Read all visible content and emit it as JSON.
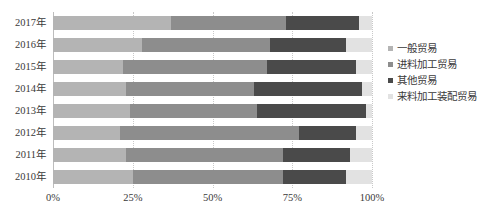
{
  "chart_data": {
    "type": "bar",
    "subtype": "stacked-bar-100-horizontal",
    "title": "",
    "xlabel": "",
    "ylabel": "",
    "orientation": "horizontal",
    "stacked": true,
    "normalized_percent": true,
    "grid": true,
    "legend_position": "right",
    "xlim": [
      0,
      100
    ],
    "xticks": [
      0,
      25,
      50,
      75,
      100
    ],
    "xticklabels": [
      "0%",
      "25%",
      "50%",
      "75%",
      "100%"
    ],
    "categories": [
      "2017年",
      "2016年",
      "2015年",
      "2014年",
      "2013年",
      "2012年",
      "2011年",
      "2010年"
    ],
    "series": [
      {
        "name": "一般贸易",
        "color": "#b4b4b4",
        "values": [
          37,
          28,
          22,
          23,
          24,
          21,
          23,
          25
        ]
      },
      {
        "name": "进料加工贸易",
        "color": "#8d8d8d",
        "values": [
          36,
          40,
          45,
          40,
          40,
          56,
          49,
          47
        ]
      },
      {
        "name": "其他贸易",
        "color": "#4a4a4a",
        "values": [
          23,
          24,
          28,
          34,
          34,
          18,
          21,
          20
        ]
      },
      {
        "name": "来料加工装配贸易",
        "color": "#e2e2e2",
        "values": [
          4,
          8,
          5,
          3,
          2,
          5,
          7,
          8
        ]
      }
    ]
  },
  "legend": {
    "items": [
      {
        "label": "一般贸易",
        "color": "#b4b4b4"
      },
      {
        "label": "进料加工贸易",
        "color": "#8d8d8d"
      },
      {
        "label": "其他贸易",
        "color": "#4a4a4a"
      },
      {
        "label": "来料加工装配贸易",
        "color": "#e2e2e2"
      }
    ]
  }
}
